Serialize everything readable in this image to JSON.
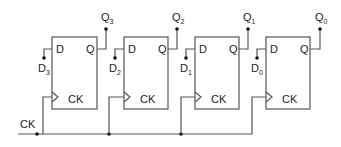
{
  "diagram": {
    "clock_label": "CK",
    "colors": {
      "wire": "#555555",
      "dot": "#111111",
      "text": "#222222",
      "background": "#ffffff"
    },
    "flipflops": [
      {
        "d_pin": "D",
        "q_pin": "Q",
        "ck_pin": "CK",
        "input": {
          "base": "D",
          "sub": "3"
        },
        "output": {
          "base": "Q",
          "sub": "3"
        }
      },
      {
        "d_pin": "D",
        "q_pin": "Q",
        "ck_pin": "CK",
        "input": {
          "base": "D",
          "sub": "2"
        },
        "output": {
          "base": "Q",
          "sub": "2"
        }
      },
      {
        "d_pin": "D",
        "q_pin": "Q",
        "ck_pin": "CK",
        "input": {
          "base": "D",
          "sub": "1"
        },
        "output": {
          "base": "Q",
          "sub": "1"
        }
      },
      {
        "d_pin": "D",
        "q_pin": "Q",
        "ck_pin": "CK",
        "input": {
          "base": "D",
          "sub": "0"
        },
        "output": {
          "base": "Q",
          "sub": "0"
        }
      }
    ]
  }
}
